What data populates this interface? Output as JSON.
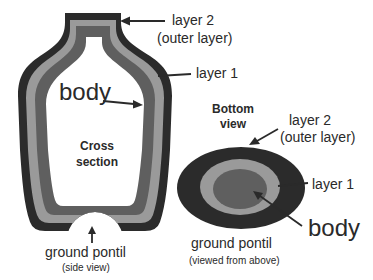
{
  "side_view": {
    "label_layer2_line1": "layer 2",
    "label_layer2_line2": "(outer layer)",
    "label_layer1": "layer 1",
    "label_body": "body",
    "label_cross_line1": "Cross",
    "label_cross_line2": "section",
    "label_pontil": "ground pontil",
    "label_pontil_sub": "(side view)"
  },
  "bottom_view": {
    "label_title_line1": "Bottom",
    "label_title_line2": "view",
    "label_layer2_line1": "layer 2",
    "label_layer2_line2": "(outer layer)",
    "label_layer1": "layer 1",
    "label_body": "body",
    "label_pontil": "ground pontil",
    "label_pontil_sub": "(viewed from above)"
  },
  "colors": {
    "layer2": "#2b2b2b",
    "layer1": "#9a9a9a",
    "body": "#5f5f5f",
    "background": "#ffffff"
  }
}
